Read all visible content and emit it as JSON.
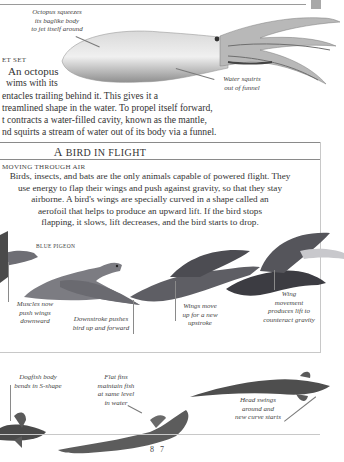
{
  "page": {
    "number": "8 7",
    "tab_color": "#a8a8a8"
  },
  "octopus_section": {
    "callouts": {
      "squeezes": "Octopus squeezes its baglike body to jet itself around",
      "squeezes_lines": [
        "Octopus squeezes",
        "its baglike body",
        "to jet itself around"
      ],
      "water": "Water squirts out of funnel",
      "water_lines": [
        "Water squirts",
        "out of funnel"
      ]
    },
    "heading": "JET SET",
    "heading_visible": "ET SET",
    "paragraph_lines": [
      "An octopus",
      "wims with its",
      "entacles trailing behind it. This gives it a",
      "treamlined shape in the water. To propel itself forward,",
      "t contracts a water-filled cavity, known as the mantle,",
      "nd squirts a stream of water out of its body via a funnel."
    ]
  },
  "bird_section": {
    "title_initial": "A",
    "title_rest": "BIRD IN FLIGHT",
    "subheading": "MOVING THROUGH AIR",
    "subheading_visible": "MOVING THROUGH AIR",
    "paragraph_lines": [
      "Birds, insects, and bats are the only animals capable of powered flight. They",
      "use energy to flap their wings and push against gravity, so that they stay",
      "airborne. A bird's wings are specially curved in a shape called an",
      "aerofoil that helps to produce an upward lift. If the bird stops",
      "flapping, it slows, lift decreases, and the bird starts to drop."
    ],
    "species_label": "BLUE PIGEON",
    "callouts": [
      {
        "lines": [
          "Muscles now",
          "push wings",
          "downward"
        ]
      },
      {
        "lines": [
          "Downstroke pushes",
          "bird up and forward"
        ]
      },
      {
        "lines": [
          "Wings move",
          "up for a new",
          "upstroke"
        ]
      },
      {
        "lines": [
          "Wing",
          "movement",
          "produces lift to",
          "counteract gravity"
        ]
      }
    ]
  },
  "fish_section": {
    "callouts": [
      {
        "lines": [
          "Dogfish body",
          "bends in S-shape"
        ]
      },
      {
        "lines": [
          "Flat fins",
          "maintain fish",
          "at same level",
          "in water"
        ]
      },
      {
        "lines": [
          "Head swings",
          "around and",
          "new curve starts"
        ]
      }
    ]
  }
}
